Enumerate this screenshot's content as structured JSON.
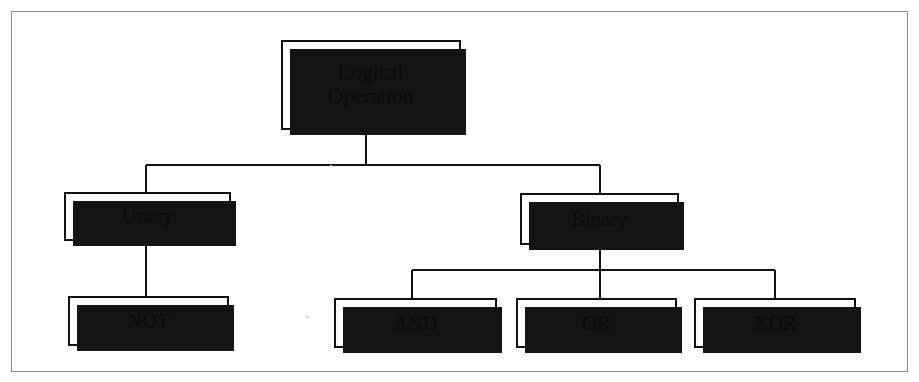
{
  "diagram": {
    "type": "tree",
    "frame": {
      "visible": true,
      "border_color": "#8d8d8d"
    },
    "node_style": {
      "fill": "#ffffff",
      "border_color": "#111111",
      "shadow_color": "#141414",
      "text_color": "#0d0d0d"
    },
    "connector_color": "#111111",
    "nodes": {
      "root": {
        "label": "Logical\nOperation"
      },
      "unary": {
        "label": "Unary"
      },
      "binary": {
        "label": "Binary"
      },
      "not": {
        "label": "NOT"
      },
      "and": {
        "label": "AND"
      },
      "or": {
        "label": "OR"
      },
      "xor": {
        "label": "XOR"
      }
    },
    "edges": [
      {
        "from": "root",
        "to": "unary"
      },
      {
        "from": "root",
        "to": "binary"
      },
      {
        "from": "unary",
        "to": "not"
      },
      {
        "from": "binary",
        "to": "and"
      },
      {
        "from": "binary",
        "to": "or"
      },
      {
        "from": "binary",
        "to": "xor"
      }
    ]
  }
}
